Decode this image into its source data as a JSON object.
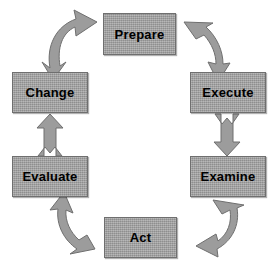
{
  "diagram": {
    "type": "cyclical-process-diagram",
    "background_color": "#ffffff",
    "node_fill_color": "#9c9c9c",
    "node_border_color": "#6f6f6f",
    "arrow_fill_color": "#9c9c9c",
    "arrow_border_color": "#6f6f6f",
    "label_color": "#000000",
    "nodes": [
      {
        "id": "prepare",
        "label": "Prepare",
        "position": "top"
      },
      {
        "id": "execute",
        "label": "Execute",
        "position": "right-upper"
      },
      {
        "id": "examine",
        "label": "Examine",
        "position": "right-lower"
      },
      {
        "id": "act",
        "label": "Act",
        "position": "bottom"
      },
      {
        "id": "evaluate",
        "label": "Evaluate",
        "position": "left-lower"
      },
      {
        "id": "change",
        "label": "Change",
        "position": "left-upper"
      }
    ],
    "connectors": [
      {
        "id": "prepare-to-execute",
        "from": "Prepare",
        "to": "Execute",
        "style": "curved",
        "icon": "curved-arrow-down-right-icon"
      },
      {
        "id": "execute-to-examine",
        "from": "Execute",
        "to": "Examine",
        "style": "straight",
        "icon": "arrow-down-icon"
      },
      {
        "id": "examine-to-act",
        "from": "Examine",
        "to": "Act",
        "style": "curved",
        "icon": "curved-arrow-down-left-icon"
      },
      {
        "id": "act-to-evaluate",
        "from": "Act",
        "to": "Evaluate",
        "style": "curved",
        "icon": "curved-arrow-up-left-icon"
      },
      {
        "id": "evaluate-to-change",
        "from": "Evaluate",
        "to": "Change",
        "style": "straight",
        "icon": "arrow-up-icon"
      },
      {
        "id": "change-to-prepare",
        "from": "Change",
        "to": "Prepare",
        "style": "curved",
        "icon": "curved-arrow-up-right-icon"
      }
    ]
  }
}
